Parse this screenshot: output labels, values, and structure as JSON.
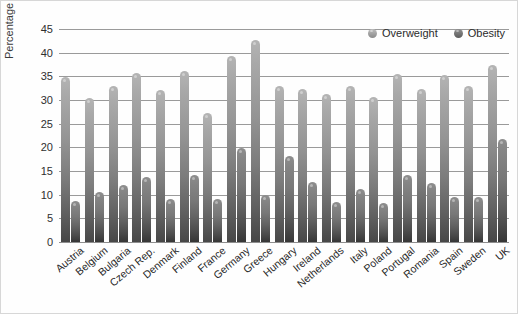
{
  "chart_data": {
    "type": "bar",
    "title": "",
    "subtitle": "",
    "xlabel": "",
    "ylabel": "Percentage population",
    "ylim": [
      0,
      45
    ],
    "ytick_labels": [
      "0",
      "5",
      "10",
      "15",
      "20",
      "25",
      "30",
      "35",
      "40",
      "45"
    ],
    "ytick_values": [
      0,
      5,
      10,
      15,
      20,
      25,
      30,
      35,
      40,
      45
    ],
    "grid": true,
    "legend_position": "top-right",
    "categories": [
      "Austria",
      "Belgium",
      "Bulgaria",
      "Czech Rep.",
      "Denmark",
      "Finland",
      "France",
      "Germany",
      "Greece",
      "Hungary",
      "Ireland",
      "Netherlands",
      "Italy",
      "Poland",
      "Portugal",
      "Romania",
      "Spain",
      "Sweden",
      "UK"
    ],
    "series": [
      {
        "name": "Overweight",
        "color": "#9a9a9a",
        "values": [
          34.8,
          30.4,
          33.0,
          35.8,
          32.2,
          36.2,
          27.2,
          39.2,
          42.7,
          33.0,
          32.4,
          31.2,
          33.0,
          30.6,
          35.4,
          32.3,
          35.2,
          33.0,
          37.3
        ]
      },
      {
        "name": "Obesity",
        "color": "#6b6b6b",
        "values": [
          8.6,
          10.6,
          12.0,
          13.8,
          9.0,
          14.2,
          9.0,
          19.8,
          10.0,
          18.2,
          12.7,
          8.4,
          11.1,
          8.2,
          14.2,
          12.4,
          9.6,
          9.6,
          21.8
        ]
      }
    ]
  },
  "legend": {
    "items": [
      {
        "label": "Overweight",
        "swatch": "overweight-swatch"
      },
      {
        "label": "Obesity",
        "swatch": "obesity-swatch"
      }
    ]
  },
  "axes": {
    "y_title": "Percentage population"
  }
}
